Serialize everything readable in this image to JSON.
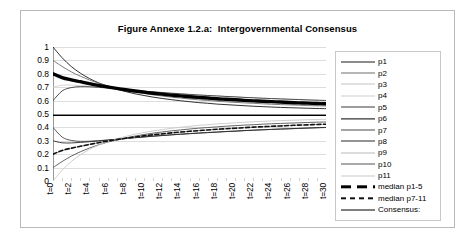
{
  "chart_data": {
    "type": "line",
    "title": "Figure Annexe 1.2.a:  Intergovernmental Consensus",
    "xlabel": "",
    "ylabel": "",
    "xlim": [
      0,
      30
    ],
    "ylim": [
      0,
      1
    ],
    "grid": true,
    "legend_position": "right",
    "x": [
      0,
      1,
      2,
      3,
      4,
      5,
      6,
      7,
      8,
      9,
      10,
      11,
      12,
      13,
      14,
      15,
      16,
      17,
      18,
      19,
      20,
      21,
      22,
      23,
      24,
      25,
      26,
      27,
      28,
      29,
      30
    ],
    "x_tick_labels": [
      "t=0",
      "t=2",
      "t=4",
      "t=6",
      "t=8",
      "t=10",
      "t=12",
      "t=14",
      "t=16",
      "t=18",
      "t=20",
      "t=22",
      "t=24",
      "t=26",
      "t=28",
      "t=30"
    ],
    "y_tick_labels": [
      "1",
      "0.9",
      "0.8",
      "0.7",
      "0.6",
      "0.5",
      "0.4",
      "0.3",
      "0.2",
      "0.1",
      "0"
    ],
    "series": [
      {
        "name": "p1",
        "color": "#1a1a1a",
        "width": 0.9,
        "style": "solid",
        "values": [
          1.0,
          0.92,
          0.855,
          0.805,
          0.765,
          0.733,
          0.707,
          0.685,
          0.667,
          0.651,
          0.638,
          0.626,
          0.616,
          0.607,
          0.599,
          0.592,
          0.585,
          0.58,
          0.574,
          0.57,
          0.566,
          0.562,
          0.558,
          0.555,
          0.552,
          0.549,
          0.547,
          0.545,
          0.543,
          0.541,
          0.54
        ]
      },
      {
        "name": "p2",
        "color": "#6e6e6e",
        "width": 0.9,
        "style": "solid",
        "values": [
          0.9,
          0.855,
          0.815,
          0.782,
          0.754,
          0.73,
          0.71,
          0.693,
          0.678,
          0.665,
          0.653,
          0.643,
          0.634,
          0.626,
          0.619,
          0.612,
          0.606,
          0.601,
          0.596,
          0.591,
          0.587,
          0.583,
          0.58,
          0.576,
          0.573,
          0.57,
          0.568,
          0.566,
          0.563,
          0.561,
          0.56
        ]
      },
      {
        "name": "p3",
        "color": "#c4c4c4",
        "width": 0.9,
        "style": "solid",
        "values": [
          0.8,
          0.775,
          0.757,
          0.741,
          0.727,
          0.714,
          0.702,
          0.691,
          0.681,
          0.672,
          0.663,
          0.656,
          0.648,
          0.642,
          0.635,
          0.63,
          0.624,
          0.619,
          0.615,
          0.61,
          0.606,
          0.602,
          0.599,
          0.595,
          0.592,
          0.589,
          0.586,
          0.584,
          0.581,
          0.579,
          0.577
        ]
      },
      {
        "name": "p4",
        "color": "#d0d0d0",
        "width": 0.9,
        "style": "solid",
        "values": [
          0.7,
          0.715,
          0.716,
          0.712,
          0.707,
          0.701,
          0.695,
          0.689,
          0.683,
          0.677,
          0.671,
          0.666,
          0.661,
          0.656,
          0.651,
          0.647,
          0.643,
          0.639,
          0.635,
          0.631,
          0.628,
          0.624,
          0.621,
          0.618,
          0.615,
          0.612,
          0.61,
          0.607,
          0.605,
          0.602,
          0.6
        ]
      },
      {
        "name": "p5",
        "color": "#3a3a3a",
        "width": 0.9,
        "style": "solid",
        "values": [
          0.6,
          0.672,
          0.697,
          0.704,
          0.703,
          0.699,
          0.694,
          0.688,
          0.682,
          0.676,
          0.671,
          0.665,
          0.66,
          0.655,
          0.651,
          0.646,
          0.642,
          0.638,
          0.635,
          0.631,
          0.628,
          0.624,
          0.621,
          0.618,
          0.615,
          0.613,
          0.61,
          0.608,
          0.605,
          0.603,
          0.601
        ]
      },
      {
        "name": "p6",
        "color": "#000000",
        "width": 1.1,
        "style": "solid",
        "values": [
          0.49,
          0.49,
          0.49,
          0.49,
          0.49,
          0.49,
          0.49,
          0.49,
          0.49,
          0.49,
          0.49,
          0.49,
          0.49,
          0.49,
          0.49,
          0.49,
          0.49,
          0.49,
          0.49,
          0.49,
          0.49,
          0.49,
          0.49,
          0.49,
          0.49,
          0.49,
          0.49,
          0.49,
          0.49,
          0.49,
          0.49
        ]
      },
      {
        "name": "p7",
        "color": "#4a4a4a",
        "width": 0.9,
        "style": "solid",
        "values": [
          0.4,
          0.328,
          0.303,
          0.296,
          0.297,
          0.301,
          0.306,
          0.312,
          0.318,
          0.324,
          0.329,
          0.335,
          0.34,
          0.345,
          0.349,
          0.354,
          0.358,
          0.362,
          0.365,
          0.369,
          0.372,
          0.376,
          0.379,
          0.382,
          0.385,
          0.387,
          0.39,
          0.392,
          0.395,
          0.397,
          0.399
        ]
      },
      {
        "name": "p8",
        "color": "#2a2a2a",
        "width": 0.9,
        "style": "solid",
        "values": [
          0.3,
          0.285,
          0.284,
          0.288,
          0.293,
          0.299,
          0.305,
          0.311,
          0.317,
          0.323,
          0.329,
          0.334,
          0.339,
          0.344,
          0.349,
          0.353,
          0.357,
          0.361,
          0.365,
          0.369,
          0.372,
          0.376,
          0.379,
          0.382,
          0.385,
          0.388,
          0.39,
          0.393,
          0.395,
          0.398,
          0.4
        ]
      },
      {
        "name": "p9",
        "color": "#b9b9b9",
        "width": 0.9,
        "style": "solid",
        "values": [
          0.2,
          0.225,
          0.243,
          0.259,
          0.273,
          0.286,
          0.298,
          0.309,
          0.319,
          0.328,
          0.337,
          0.344,
          0.352,
          0.358,
          0.365,
          0.37,
          0.376,
          0.381,
          0.385,
          0.39,
          0.394,
          0.398,
          0.401,
          0.405,
          0.408,
          0.411,
          0.414,
          0.416,
          0.419,
          0.421,
          0.423
        ]
      },
      {
        "name": "p10",
        "color": "#555555",
        "width": 0.9,
        "style": "solid",
        "values": [
          0.1,
          0.145,
          0.185,
          0.218,
          0.246,
          0.27,
          0.29,
          0.307,
          0.322,
          0.335,
          0.347,
          0.357,
          0.366,
          0.374,
          0.381,
          0.388,
          0.394,
          0.399,
          0.404,
          0.409,
          0.413,
          0.417,
          0.42,
          0.424,
          0.427,
          0.43,
          0.432,
          0.434,
          0.437,
          0.439,
          0.44
        ]
      },
      {
        "name": "p11",
        "color": "#c9c9c9",
        "width": 0.9,
        "style": "solid",
        "values": [
          0.0,
          0.08,
          0.145,
          0.195,
          0.235,
          0.267,
          0.293,
          0.315,
          0.333,
          0.349,
          0.362,
          0.374,
          0.384,
          0.393,
          0.401,
          0.408,
          0.415,
          0.42,
          0.426,
          0.43,
          0.434,
          0.438,
          0.442,
          0.445,
          0.448,
          0.451,
          0.453,
          0.455,
          0.457,
          0.459,
          0.46
        ]
      },
      {
        "name": "median p1-5",
        "color": "#000000",
        "width": 3.4,
        "style": "solid",
        "values": [
          0.8,
          0.772,
          0.755,
          0.741,
          0.727,
          0.714,
          0.702,
          0.691,
          0.681,
          0.672,
          0.663,
          0.655,
          0.648,
          0.641,
          0.635,
          0.629,
          0.624,
          0.619,
          0.614,
          0.61,
          0.606,
          0.602,
          0.598,
          0.595,
          0.592,
          0.589,
          0.586,
          0.583,
          0.581,
          0.578,
          0.576
        ]
      },
      {
        "name": "median p7-11",
        "color": "#111111",
        "width": 1.6,
        "style": "dashed",
        "values": [
          0.2,
          0.228,
          0.245,
          0.259,
          0.273,
          0.286,
          0.298,
          0.309,
          0.319,
          0.328,
          0.337,
          0.345,
          0.352,
          0.359,
          0.365,
          0.371,
          0.376,
          0.381,
          0.386,
          0.39,
          0.394,
          0.398,
          0.402,
          0.405,
          0.408,
          0.411,
          0.414,
          0.417,
          0.419,
          0.422,
          0.424
        ]
      },
      {
        "name": "Consensus:",
        "color": "#000000",
        "width": 1.0,
        "style": "solid",
        "values": [
          0.49,
          0.49,
          0.49,
          0.49,
          0.49,
          0.49,
          0.49,
          0.49,
          0.49,
          0.49,
          0.49,
          0.49,
          0.49,
          0.49,
          0.49,
          0.49,
          0.49,
          0.49,
          0.49,
          0.49,
          0.49,
          0.49,
          0.49,
          0.49,
          0.49,
          0.49,
          0.49,
          0.49,
          0.49,
          0.49,
          0.49
        ]
      }
    ],
    "legend_entries": [
      {
        "label": "p1",
        "color": "#1a1a1a",
        "style": "solid",
        "width": 1.0
      },
      {
        "label": "p2",
        "color": "#6e6e6e",
        "style": "solid",
        "width": 1.0
      },
      {
        "label": "p3",
        "color": "#c4c4c4",
        "style": "solid",
        "width": 1.0
      },
      {
        "label": "p4",
        "color": "#d0d0d0",
        "style": "solid",
        "width": 1.0
      },
      {
        "label": "p5",
        "color": "#3a3a3a",
        "style": "solid",
        "width": 1.0
      },
      {
        "label": "p6",
        "color": "#000000",
        "style": "solid",
        "width": 1.2
      },
      {
        "label": "p7",
        "color": "#4a4a4a",
        "style": "solid",
        "width": 1.0
      },
      {
        "label": "p8",
        "color": "#2a2a2a",
        "style": "solid",
        "width": 1.0
      },
      {
        "label": "p9",
        "color": "#b9b9b9",
        "style": "solid",
        "width": 1.0
      },
      {
        "label": "p10",
        "color": "#555555",
        "style": "solid",
        "width": 1.0
      },
      {
        "label": "p11",
        "color": "#c9c9c9",
        "style": "solid",
        "width": 1.0
      },
      {
        "label": "median p1-5",
        "color": "#000000",
        "style": "dashed-thick",
        "width": 3.4
      },
      {
        "label": "median p7-11",
        "color": "#111111",
        "style": "dashed",
        "width": 1.4
      },
      {
        "label": "Consensus:",
        "color": "#000000",
        "style": "solid",
        "width": 1.0
      }
    ],
    "colors": {
      "gridline": "#d4d4d4",
      "axis": "#9a9a9a",
      "frame": "#b9b9b9",
      "text": "#000000"
    }
  }
}
